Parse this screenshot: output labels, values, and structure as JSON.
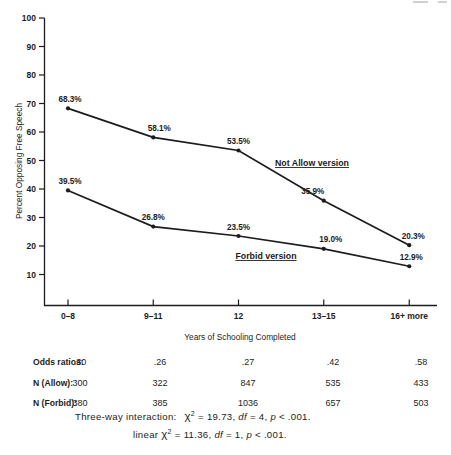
{
  "colors": {
    "ink": "#1c1c1c",
    "paper": "#ffffff"
  },
  "chart_data": {
    "type": "line",
    "title": "",
    "xlabel": "Years of Schooling Completed",
    "ylabel": "Percent Opposing Free Speech",
    "categories": [
      "0–8",
      "9–11",
      "12",
      "13–15",
      "16+ more"
    ],
    "ylim": [
      0,
      100
    ],
    "yticks": [
      10,
      20,
      30,
      40,
      50,
      60,
      70,
      80,
      90,
      100
    ],
    "grid": false,
    "legend_position": "inline-annotations",
    "series": [
      {
        "name": "Not Allow version",
        "values": [
          68.3,
          58.1,
          53.5,
          35.9,
          20.3
        ],
        "point_labels": [
          "68.3%",
          "58.1%",
          "53.5%",
          "35.9%",
          "20.3%"
        ]
      },
      {
        "name": "Forbid version",
        "values": [
          39.5,
          26.8,
          23.5,
          19.0,
          12.9
        ],
        "point_labels": [
          "39.5%",
          "26.8%",
          "23.5%",
          "19.0%",
          "12.9%"
        ]
      }
    ]
  },
  "table": {
    "rows": [
      {
        "label": "Odds ratios:",
        "values": [
          ".30",
          ".26",
          ".27",
          ".42",
          ".58"
        ]
      },
      {
        "label": "N (Allow):",
        "values": [
          "300",
          "322",
          "847",
          "535",
          "433"
        ]
      },
      {
        "label": "N (Forbid):",
        "values": [
          "380",
          "385",
          "1036",
          "657",
          "503"
        ]
      }
    ]
  },
  "stats": [
    {
      "prefix": "Three-way interaction:",
      "chi": "χ",
      "sup": "2",
      "seg1": "= 19.73,",
      "df_label": "df",
      "seg2": "= 4,",
      "p_label": "p",
      "seg3": "< .001."
    },
    {
      "prefix": "linear",
      "chi": "χ",
      "sup": "2",
      "seg1": "= 11.36,",
      "df_label": "df",
      "seg2": "= 1,",
      "p_label": "p",
      "seg3": "< .001."
    }
  ]
}
